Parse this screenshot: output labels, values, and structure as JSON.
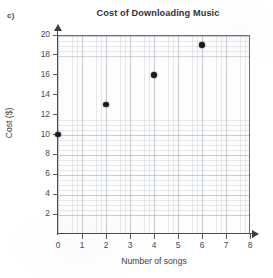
{
  "figure": {
    "part_label": "c)"
  },
  "chart_data": {
    "type": "scatter",
    "title": "Cost of Downloading Music",
    "xlabel": "Number of songs",
    "ylabel": "Cost ($)",
    "x": [
      0,
      2,
      4,
      6
    ],
    "y": [
      10,
      13,
      16,
      19
    ],
    "points": [
      {
        "x": 0,
        "y": 10
      },
      {
        "x": 2,
        "y": 13
      },
      {
        "x": 4,
        "y": 16
      },
      {
        "x": 6,
        "y": 19
      }
    ],
    "xlim": [
      0,
      8
    ],
    "ylim": [
      0,
      20
    ],
    "xticks": [
      0,
      1,
      2,
      3,
      4,
      5,
      6,
      7,
      8
    ],
    "yticks": [
      2,
      4,
      6,
      8,
      10,
      12,
      14,
      16,
      18,
      20
    ],
    "xtick_labels": [
      "0",
      "1",
      "2",
      "3",
      "4",
      "5",
      "6",
      "7",
      "8"
    ],
    "ytick_labels": [
      "2",
      "4",
      "6",
      "8",
      "10",
      "12",
      "14",
      "16",
      "18",
      "20"
    ],
    "grid": true,
    "legend": null,
    "marker_color": "#1a1a1a",
    "axis_color": "#4a4a4a",
    "grid_color": "#b0b8c0",
    "background_color": "#ffffff"
  }
}
